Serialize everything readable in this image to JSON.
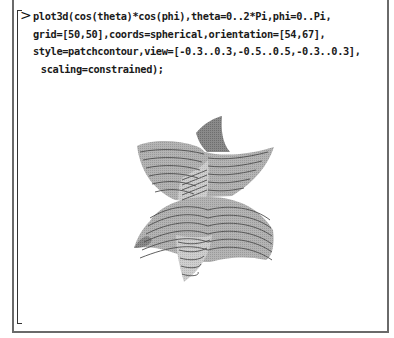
{
  "worksheet": {
    "prompt_symbol": ">",
    "command_lines": [
      "plot3d(cos(theta)*cos(phi),theta=0..2*Pi,phi=0..Pi,",
      "grid=[50,50],coords=spherical,orientation=[54,67],",
      "style=patchcontour,view=[-0.3..0.3,-0.5..0.5,-0.3..0.3],",
      " scaling=constrained);"
    ],
    "output": {
      "type": "3d-plot",
      "style": "patchcontour",
      "description": "Spherical surface plot rendered with gray shaded patches and contour lines"
    }
  },
  "colors": {
    "frame": "#6a6a6a",
    "text": "#1a1a1a",
    "patch_light": "#c8c8c8",
    "patch_mid": "#a8a8a8",
    "patch_dark": "#7a7a7a",
    "contour": "#555555"
  }
}
